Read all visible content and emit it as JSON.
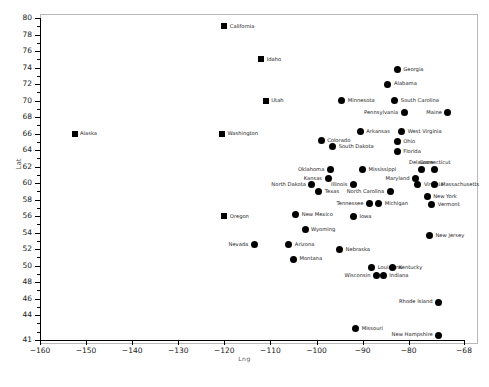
{
  "chart_data": {
    "type": "scatter",
    "title": "",
    "xlabel": "Lng",
    "ylabel": "Lat",
    "xlim": [
      -160,
      -68
    ],
    "ylim": [
      41,
      80
    ],
    "grid": false,
    "legend": "none",
    "xticks": [
      -160,
      -150,
      -140,
      -130,
      -120,
      -110,
      -100,
      -90,
      -80,
      -68
    ],
    "yticks": [
      41,
      44,
      46,
      48,
      50,
      52,
      54,
      56,
      58,
      60,
      62,
      64,
      66,
      68,
      70,
      72,
      74,
      76,
      78,
      80
    ],
    "marker_color": "#000000",
    "points": [
      {
        "label": "California",
        "x": -120.0,
        "y": 79.0,
        "marker": "square",
        "side": "right"
      },
      {
        "label": "Idaho",
        "x": -112.0,
        "y": 75.0,
        "marker": "square",
        "side": "right"
      },
      {
        "label": "Georgia",
        "x": -82.5,
        "y": 73.8,
        "marker": "circle",
        "side": "right"
      },
      {
        "label": "Alabama",
        "x": -84.5,
        "y": 72.0,
        "marker": "circle",
        "side": "right"
      },
      {
        "label": "Utah",
        "x": -111.0,
        "y": 70.0,
        "marker": "square",
        "side": "right"
      },
      {
        "label": "Minnesota",
        "x": -94.5,
        "y": 70.0,
        "marker": "circle",
        "side": "right"
      },
      {
        "label": "South Carolina",
        "x": -83.0,
        "y": 70.0,
        "marker": "circle",
        "side": "right"
      },
      {
        "label": "Pennsylvania",
        "x": -81.0,
        "y": 68.6,
        "marker": "circle",
        "side": "left"
      },
      {
        "label": "Maine",
        "x": -71.5,
        "y": 68.6,
        "marker": "circle",
        "side": "left"
      },
      {
        "label": "Alaska",
        "x": -152.5,
        "y": 66.0,
        "marker": "square",
        "side": "right"
      },
      {
        "label": "Washington",
        "x": -120.5,
        "y": 66.0,
        "marker": "square",
        "side": "right"
      },
      {
        "label": "Arkansas",
        "x": -90.5,
        "y": 66.3,
        "marker": "circle",
        "side": "right"
      },
      {
        "label": "West Virginia",
        "x": -81.5,
        "y": 66.3,
        "marker": "circle",
        "side": "right"
      },
      {
        "label": "Colorado",
        "x": -99.0,
        "y": 65.2,
        "marker": "circle",
        "side": "right"
      },
      {
        "label": "Ohio",
        "x": -82.5,
        "y": 65.0,
        "marker": "circle",
        "side": "right"
      },
      {
        "label": "South Dakota",
        "x": -96.5,
        "y": 64.4,
        "marker": "circle",
        "side": "right"
      },
      {
        "label": "Florida",
        "x": -82.5,
        "y": 63.8,
        "marker": "circle",
        "side": "right"
      },
      {
        "label": "Delaware",
        "x": -77.3,
        "y": 61.6,
        "marker": "circle",
        "side": "above"
      },
      {
        "label": "Connecticut",
        "x": -74.3,
        "y": 61.6,
        "marker": "circle",
        "side": "above"
      },
      {
        "label": "Oklahoma",
        "x": -97.0,
        "y": 61.6,
        "marker": "circle",
        "side": "left"
      },
      {
        "label": "Mississippi",
        "x": -90.0,
        "y": 61.6,
        "marker": "circle",
        "side": "right"
      },
      {
        "label": "Maryland",
        "x": -78.5,
        "y": 60.6,
        "marker": "circle",
        "side": "left"
      },
      {
        "label": "Kansas",
        "x": -97.5,
        "y": 60.6,
        "marker": "circle",
        "side": "left"
      },
      {
        "label": "North Dakota",
        "x": -101.0,
        "y": 59.8,
        "marker": "circle",
        "side": "left"
      },
      {
        "label": "Virginia",
        "x": -78.0,
        "y": 59.8,
        "marker": "circle",
        "side": "right"
      },
      {
        "label": "Massachusetts",
        "x": -74.3,
        "y": 59.8,
        "marker": "circle",
        "side": "right"
      },
      {
        "label": "Illinois",
        "x": -92.0,
        "y": 59.8,
        "marker": "circle",
        "side": "left"
      },
      {
        "label": "North Carolina",
        "x": -84.0,
        "y": 59.0,
        "marker": "circle",
        "side": "left"
      },
      {
        "label": "Texas",
        "x": -99.5,
        "y": 59.0,
        "marker": "circle",
        "side": "right"
      },
      {
        "label": "New York",
        "x": -76.0,
        "y": 58.4,
        "marker": "circle",
        "side": "right"
      },
      {
        "label": "Tennessee",
        "x": -88.5,
        "y": 57.5,
        "marker": "circle",
        "side": "left"
      },
      {
        "label": "Michigan",
        "x": -86.5,
        "y": 57.5,
        "marker": "circle",
        "side": "right"
      },
      {
        "label": "Vermont",
        "x": -75.0,
        "y": 57.4,
        "marker": "circle",
        "side": "right"
      },
      {
        "label": "Oregon",
        "x": -120.0,
        "y": 56.0,
        "marker": "square",
        "side": "right"
      },
      {
        "label": "New Mexico",
        "x": -104.5,
        "y": 56.2,
        "marker": "circle",
        "side": "right"
      },
      {
        "label": "Iowa",
        "x": -92.0,
        "y": 56.0,
        "marker": "circle",
        "side": "right"
      },
      {
        "label": "Wyoming",
        "x": -102.5,
        "y": 54.4,
        "marker": "circle",
        "side": "right"
      },
      {
        "label": "New Jersey",
        "x": -75.5,
        "y": 53.6,
        "marker": "circle",
        "side": "right"
      },
      {
        "label": "Nevada",
        "x": -113.5,
        "y": 52.6,
        "marker": "circle",
        "side": "left"
      },
      {
        "label": "Arizona",
        "x": -106.0,
        "y": 52.6,
        "marker": "circle",
        "side": "right"
      },
      {
        "label": "Nebraska",
        "x": -95.0,
        "y": 52.0,
        "marker": "circle",
        "side": "right"
      },
      {
        "label": "Montana",
        "x": -105.0,
        "y": 50.8,
        "marker": "circle",
        "side": "right"
      },
      {
        "label": "Louisiana",
        "x": -88.0,
        "y": 49.8,
        "marker": "circle",
        "side": "right"
      },
      {
        "label": "Kentucky",
        "x": -83.5,
        "y": 49.8,
        "marker": "circle",
        "side": "right"
      },
      {
        "label": "Wisconsin",
        "x": -87.0,
        "y": 48.8,
        "marker": "circle",
        "side": "left"
      },
      {
        "label": "Indiana",
        "x": -85.5,
        "y": 48.8,
        "marker": "circle",
        "side": "right"
      },
      {
        "label": "Rhode Island",
        "x": -73.5,
        "y": 45.6,
        "marker": "circle",
        "side": "left"
      },
      {
        "label": "Missouri",
        "x": -91.5,
        "y": 42.4,
        "marker": "circle",
        "side": "right"
      },
      {
        "label": "New Hampshire",
        "x": -73.5,
        "y": 41.6,
        "marker": "circle",
        "side": "left"
      }
    ]
  }
}
